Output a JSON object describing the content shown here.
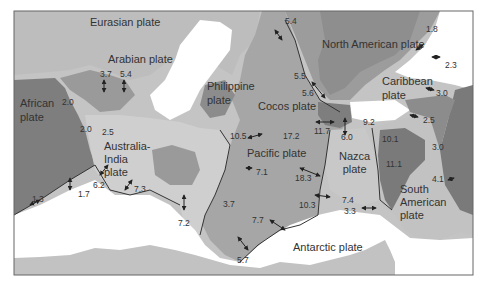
{
  "figure": {
    "colors": {
      "ocean_light": "#c8c8c8",
      "pacific": "#a9a9a9",
      "medium_plate": "#9a9a9a",
      "dark_plate": "#7a7a7a",
      "land_white": "#ffffff",
      "outline": "#333333",
      "frame": "#666666"
    }
  },
  "plates": [
    {
      "name": "Eurasian plate",
      "x": 90,
      "y": 19
    },
    {
      "name": "Arabian plate",
      "x": 108,
      "y": 56
    },
    {
      "name": "African plate",
      "x": 18,
      "y": 98,
      "lines": [
        "African",
        "plate"
      ]
    },
    {
      "name": "Philippine plate",
      "x": 207,
      "y": 82,
      "lines": [
        "Philippine",
        "plate"
      ]
    },
    {
      "name": "North American plate",
      "x": 322,
      "y": 40
    },
    {
      "name": "Caribbean plate",
      "x": 382,
      "y": 78,
      "lines": [
        "Caribbean",
        "plate"
      ]
    },
    {
      "name": "Cocos plate",
      "x": 258,
      "y": 104
    },
    {
      "name": "Australia-India plate",
      "x": 104,
      "y": 140,
      "lines": [
        "Australia-",
        "India",
        "plate"
      ]
    },
    {
      "name": "Pacific plate",
      "x": 247,
      "y": 150
    },
    {
      "name": "Nazca plate",
      "x": 337,
      "y": 151,
      "lines": [
        "Nazca",
        "plate"
      ]
    },
    {
      "name": "South American plate",
      "x": 398,
      "y": 183,
      "lines": [
        "South",
        "American",
        "plate"
      ]
    },
    {
      "name": "Antarctic plate",
      "x": 293,
      "y": 244
    }
  ],
  "rates": [
    {
      "value": "3.7",
      "x": 100,
      "y": 70
    },
    {
      "value": "5.4",
      "x": 120,
      "y": 70
    },
    {
      "value": "2.0",
      "x": 62,
      "y": 98
    },
    {
      "value": "2.0",
      "x": 80,
      "y": 123
    },
    {
      "value": "2.5",
      "x": 102,
      "y": 128
    },
    {
      "value": "10.5",
      "x": 228,
      "y": 132
    },
    {
      "value": "5.4",
      "x": 285,
      "y": 17
    },
    {
      "value": "1.8",
      "x": 426,
      "y": 25
    },
    {
      "value": "2.3",
      "x": 444,
      "y": 61
    },
    {
      "value": "5.5",
      "x": 294,
      "y": 71
    },
    {
      "value": "5.6",
      "x": 302,
      "y": 89
    },
    {
      "value": "3.0",
      "x": 436,
      "y": 89
    },
    {
      "value": "2.5",
      "x": 422,
      "y": 116
    },
    {
      "value": "11.7",
      "x": 314,
      "y": 126
    },
    {
      "value": "6.0",
      "x": 340,
      "y": 132
    },
    {
      "value": "9.2",
      "x": 365,
      "y": 118
    },
    {
      "value": "17.2",
      "x": 283,
      "y": 132
    },
    {
      "value": "10.1",
      "x": 382,
      "y": 134
    },
    {
      "value": "3.0",
      "x": 432,
      "y": 143
    },
    {
      "value": "11.1",
      "x": 385,
      "y": 160
    },
    {
      "value": "4.1",
      "x": 432,
      "y": 175
    },
    {
      "value": "7.1",
      "x": 256,
      "y": 168
    },
    {
      "value": "18.3",
      "x": 295,
      "y": 173
    },
    {
      "value": "7.4",
      "x": 342,
      "y": 196
    },
    {
      "value": "3.3",
      "x": 344,
      "y": 207
    },
    {
      "value": "10.3",
      "x": 299,
      "y": 201
    },
    {
      "value": "1.7",
      "x": 78,
      "y": 190
    },
    {
      "value": "1.3",
      "x": 32,
      "y": 194
    },
    {
      "value": "6.2",
      "x": 93,
      "y": 181
    },
    {
      "value": "7.3",
      "x": 134,
      "y": 185
    },
    {
      "value": "3.7",
      "x": 223,
      "y": 200
    },
    {
      "value": "7.2",
      "x": 178,
      "y": 219
    },
    {
      "value": "7.7",
      "x": 252,
      "y": 216
    },
    {
      "value": "5.7",
      "x": 237,
      "y": 256
    }
  ]
}
